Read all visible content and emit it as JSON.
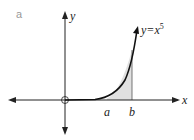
{
  "part_label": "a",
  "axes": {
    "x_label": "x",
    "y_label": "y"
  },
  "curve": {
    "equation_lhs": "y=x",
    "exponent": "5"
  },
  "bounds": {
    "lower": "a",
    "upper": "b"
  },
  "colors": {
    "curve": "#111111",
    "shade": "#e0e0e0",
    "axis": "#222222"
  }
}
